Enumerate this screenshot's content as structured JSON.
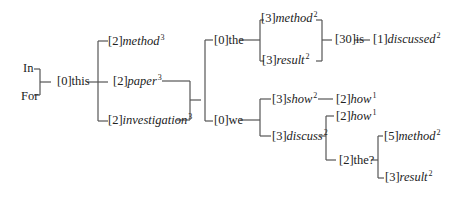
{
  "diagram": {
    "type": "word-tree",
    "line_color": "#555555",
    "nodes": [
      {
        "id": "in",
        "prefix": "",
        "word": "In",
        "italic": false,
        "sup": "",
        "x": 23,
        "y": 61
      },
      {
        "id": "for",
        "prefix": "",
        "word": "For",
        "italic": false,
        "sup": "",
        "x": 21,
        "y": 89
      },
      {
        "id": "this",
        "prefix": "[0]",
        "word": "this",
        "italic": false,
        "sup": "",
        "x": 57,
        "y": 74
      },
      {
        "id": "method1",
        "prefix": "[2]",
        "word": "method",
        "italic": true,
        "sup": "3",
        "x": 108,
        "y": 34
      },
      {
        "id": "paper",
        "prefix": "[2]",
        "word": "paper",
        "italic": true,
        "sup": "3",
        "x": 113,
        "y": 74
      },
      {
        "id": "investigation",
        "prefix": "[2]",
        "word": "investigation",
        "italic": true,
        "sup": "3",
        "x": 108,
        "y": 113
      },
      {
        "id": "the1",
        "prefix": "[0]",
        "word": "the",
        "italic": false,
        "sup": "",
        "x": 214,
        "y": 33
      },
      {
        "id": "we",
        "prefix": "[0]",
        "word": "we",
        "italic": false,
        "sup": "",
        "x": 214,
        "y": 113
      },
      {
        "id": "method2",
        "prefix": "[3]",
        "word": "method",
        "italic": true,
        "sup": "2",
        "x": 261,
        "y": 11
      },
      {
        "id": "result1",
        "prefix": "[3]",
        "word": "result",
        "italic": true,
        "sup": "2",
        "x": 262,
        "y": 53
      },
      {
        "id": "is",
        "prefix": "[30]",
        "word": "is",
        "italic": false,
        "sup": "",
        "x": 335,
        "y": 32
      },
      {
        "id": "discussed",
        "prefix": "[1]",
        "word": "discussed",
        "italic": true,
        "sup": "2",
        "x": 373,
        "y": 32
      },
      {
        "id": "show",
        "prefix": "[3]",
        "word": "show",
        "italic": true,
        "sup": "2",
        "x": 272,
        "y": 92
      },
      {
        "id": "how1",
        "prefix": "[2]",
        "word": "how",
        "italic": true,
        "sup": "1",
        "x": 336,
        "y": 92
      },
      {
        "id": "discuss",
        "prefix": "[3]",
        "word": "discuss",
        "italic": true,
        "sup": "2",
        "x": 272,
        "y": 129
      },
      {
        "id": "how2",
        "prefix": "[2]",
        "word": "how",
        "italic": true,
        "sup": "1",
        "x": 336,
        "y": 109
      },
      {
        "id": "the2",
        "prefix": "[2]",
        "word": "the?",
        "italic": false,
        "sup": "",
        "x": 339,
        "y": 153
      },
      {
        "id": "method3",
        "prefix": "[5]",
        "word": "method",
        "italic": true,
        "sup": "2",
        "x": 384,
        "y": 129
      },
      {
        "id": "result2",
        "prefix": "[3]",
        "word": "result",
        "italic": true,
        "sup": "2",
        "x": 385,
        "y": 170
      }
    ],
    "connectors": [
      "M40,69 L40,95",
      "M34,69 L40,69",
      "M34,95 L40,95",
      "M40,82 L51,82",
      "M87,82 L98,82",
      "M98,41 L98,121",
      "M98,41 L108,41",
      "M98,82 L108,82",
      "M98,121 L108,121",
      "M162,81 L190,81",
      "M177,120 L190,120",
      "M190,81 L190,120",
      "M190,100 L201,100",
      "M205,40 L205,121",
      "M205,40 L213,40",
      "M205,121 L213,121",
      "M240,40 L260,40",
      "M260,20 L260,61",
      "M260,20 L264,20",
      "M260,61 L264,61",
      "M316,20 L322,20",
      "M322,20 L322,61",
      "M316,61 L322,61",
      "M322,40 L332,40",
      "M354,40 L370,40",
      "M240,120 L260,120",
      "M260,99 L260,136",
      "M260,99 L271,99",
      "M260,136 L271,136",
      "M318,99 L333,99",
      "M320,136 L326,136",
      "M326,116 L326,160",
      "M326,116 L334,116",
      "M326,160 L336,160",
      "M371,160 L378,160",
      "M378,136 L378,178",
      "M378,136 L383,136",
      "M378,178 L384,178"
    ]
  }
}
